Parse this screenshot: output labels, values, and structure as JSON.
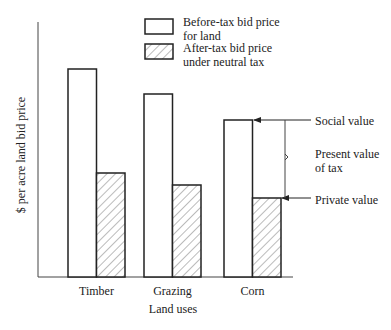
{
  "chart_data": {
    "type": "bar",
    "title": "",
    "xlabel": "Land uses",
    "ylabel": "$ per acre land bid price",
    "categories": [
      "Timber",
      "Grazing",
      "Corn"
    ],
    "series": [
      {
        "name": "Before-tax bid price for land",
        "style": "white",
        "values": [
          208,
          183,
          157
        ]
      },
      {
        "name": "After-tax bid price under neutral tax",
        "style": "hatched",
        "values": [
          104,
          92,
          79
        ]
      }
    ],
    "ylim": [
      0,
      255
    ],
    "grid": false,
    "legend_position": "top-center",
    "annotations": [
      {
        "text": "Social value",
        "target": "Corn before-tax bar top"
      },
      {
        "text": "Present value of tax",
        "target": "gap between Corn bars"
      },
      {
        "text": "Private value",
        "target": "Corn after-tax bar top"
      }
    ]
  },
  "legend": {
    "items": [
      {
        "line1": "Before-tax bid price",
        "line2": "for land"
      },
      {
        "line1": "After-tax bid price",
        "line2": "under neutral tax"
      }
    ]
  },
  "axis": {
    "xlabel": "Land uses",
    "ylabel": "$ per acre land bid price"
  },
  "annotations": {
    "social": "Social value",
    "pv_line1": "Present value",
    "pv_line2": "of tax",
    "private": "Private value"
  },
  "colors": {
    "stroke": "#222222",
    "hatch": "#777777",
    "background": "#ffffff"
  }
}
